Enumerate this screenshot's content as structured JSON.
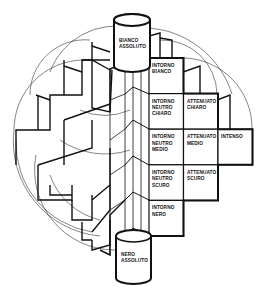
{
  "diagram": {
    "title": "",
    "colors": {
      "ink": "#111111",
      "thin": "#333333",
      "paper": "#ffffff"
    },
    "cylinders": [
      {
        "id": "bianco-assoluto",
        "label": "BIANCO\nASSOLUTO",
        "x": 114,
        "y_top": 20,
        "width": 36,
        "height": 46
      },
      {
        "id": "nero-assoluto",
        "label": "NERO\nASSOLUTO",
        "x": 116,
        "y_top": 236,
        "width": 35,
        "height": 42
      }
    ],
    "cells": [
      {
        "id": "intorno-bianco",
        "label": "INTORNO\nBIANCO",
        "col": 0,
        "row": 0
      },
      {
        "id": "intorno-neutro-chiaro",
        "label": "INTORNO\nNEUTRO\nCHIARO",
        "col": 0,
        "row": 1
      },
      {
        "id": "attenuato-chiaro",
        "label": "ATTENUATO\nCHIARO",
        "col": 1,
        "row": 1
      },
      {
        "id": "intorno-neutro-medio",
        "label": "INTORNO\nNEUTRO\nMEDIO",
        "col": 0,
        "row": 2
      },
      {
        "id": "attenuato-medio",
        "label": "ATTENUATO\nMEDIO",
        "col": 1,
        "row": 2
      },
      {
        "id": "intenso",
        "label": "INTENSO",
        "col": 2,
        "row": 2
      },
      {
        "id": "intorno-neutro-scuro",
        "label": "INTORNO\nNEUTRO\nSCURO",
        "col": 0,
        "row": 3
      },
      {
        "id": "attenuato-scuro",
        "label": "ATTENUATO\nSCURO",
        "col": 1,
        "row": 3
      },
      {
        "id": "intorno-nero",
        "label": "INTORNO\nNERO",
        "col": 0,
        "row": 4
      }
    ],
    "grid": {
      "x0": 149,
      "y0": 58,
      "col_w": 34.5,
      "row_h": 35.6
    }
  }
}
